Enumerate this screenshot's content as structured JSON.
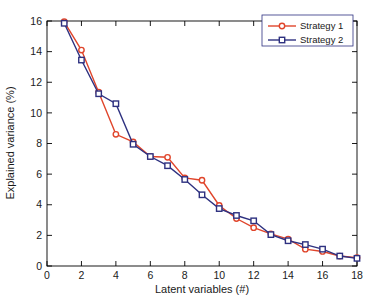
{
  "chart_data": {
    "type": "line",
    "title": "",
    "xlabel": "Latent variables (#)",
    "ylabel": "Explained variance (%)",
    "xlim": [
      0,
      18
    ],
    "ylim": [
      0,
      16
    ],
    "xticks": [
      0,
      2,
      4,
      6,
      8,
      10,
      12,
      14,
      16,
      18
    ],
    "yticks": [
      0,
      2,
      4,
      6,
      8,
      10,
      12,
      14,
      16
    ],
    "grid": false,
    "legend_position": "top-right",
    "x": [
      1,
      2,
      3,
      4,
      5,
      6,
      7,
      8,
      9,
      10,
      11,
      12,
      13,
      14,
      15,
      16,
      17,
      18
    ],
    "series": [
      {
        "name": "Strategy 1",
        "color": "#E0452B",
        "marker": "circle",
        "values": [
          15.95,
          14.1,
          11.35,
          8.6,
          8.1,
          7.15,
          7.1,
          5.75,
          5.6,
          3.95,
          3.1,
          2.5,
          2.1,
          1.75,
          1.1,
          0.95,
          0.65,
          0.55
        ]
      },
      {
        "name": "Strategy 2",
        "color": "#2E3180",
        "marker": "square",
        "values": [
          15.85,
          13.45,
          11.25,
          10.6,
          7.95,
          7.15,
          6.55,
          5.65,
          4.65,
          3.75,
          3.3,
          2.95,
          2.05,
          1.65,
          1.4,
          1.1,
          0.65,
          0.5
        ]
      }
    ]
  },
  "legend": {
    "entries": [
      {
        "label": "Strategy 1"
      },
      {
        "label": "Strategy 2"
      }
    ]
  },
  "axes": {
    "x_title": "Latent variables (#)",
    "y_title": "Explained variance (%)"
  },
  "colors": {
    "series_1": "#E0452B",
    "series_2": "#2E3180",
    "axis": "#000000",
    "background": "#ffffff"
  }
}
